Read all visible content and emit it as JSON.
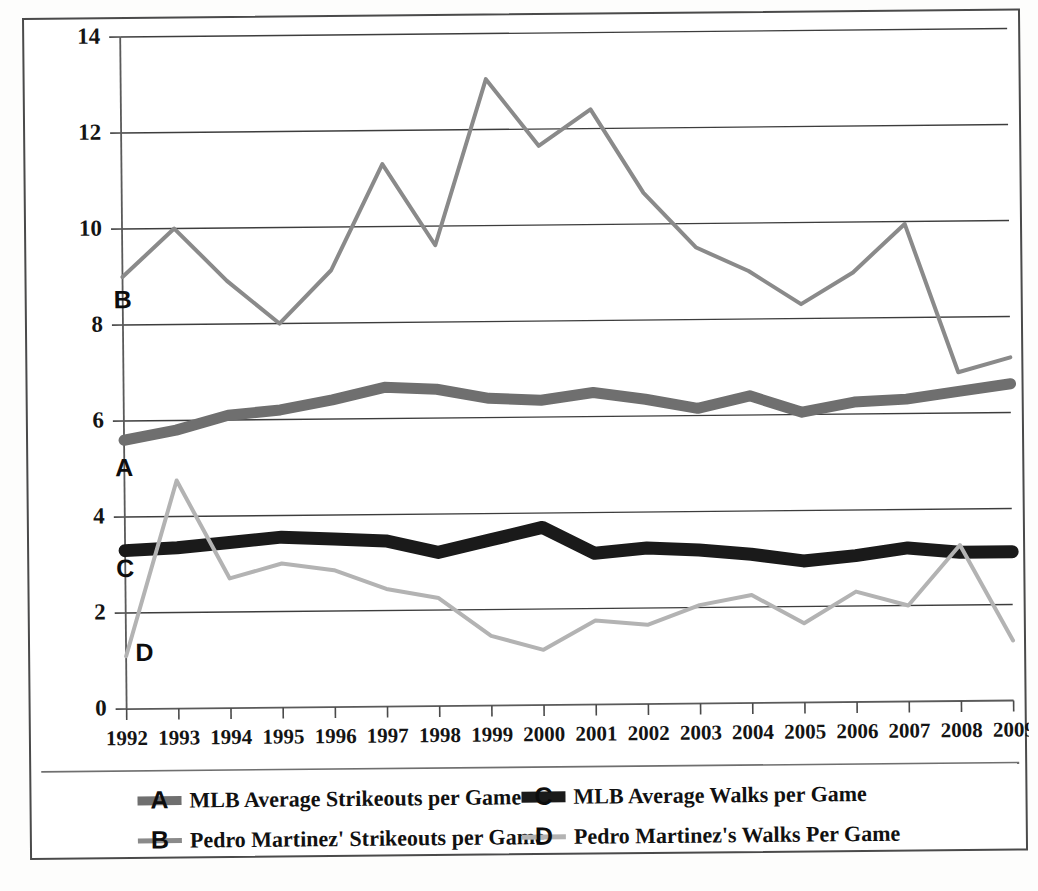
{
  "chart_data": {
    "type": "line",
    "title": "",
    "xlabel": "",
    "ylabel": "",
    "x": [
      1992,
      1993,
      1994,
      1995,
      1996,
      1997,
      1998,
      1999,
      2000,
      2001,
      2002,
      2003,
      2004,
      2005,
      2006,
      2007,
      2008,
      2009
    ],
    "categories": [
      "1992",
      "1993",
      "1994",
      "1995",
      "1996",
      "1997",
      "1998",
      "1999",
      "2000",
      "2001",
      "2002",
      "2003",
      "2004",
      "2005",
      "2006",
      "2007",
      "2008",
      "2009"
    ],
    "ylim": [
      0,
      14
    ],
    "ytick_values": [
      0,
      2,
      4,
      6,
      8,
      10,
      12,
      14
    ],
    "ytick_labels": [
      "0",
      "2",
      "4",
      "6",
      "8",
      "10",
      "12",
      "14"
    ],
    "grid": true,
    "legend_position": "bottom",
    "series": [
      {
        "key": "A",
        "tag": "A",
        "name": "MLB Average Strikeouts per Game",
        "color": "#6f6f6f",
        "width": 11,
        "values": [
          5.6,
          5.8,
          6.1,
          6.2,
          6.4,
          6.65,
          6.6,
          6.4,
          6.35,
          6.5,
          6.35,
          6.15,
          6.4,
          6.05,
          6.25,
          6.3,
          6.45,
          6.6
        ]
      },
      {
        "key": "B",
        "tag": "B",
        "name": "Pedro Martinez' Strikeouts per Game",
        "color": "#8a8a8a",
        "width": 4,
        "values": [
          9.0,
          10.0,
          8.9,
          8.0,
          9.1,
          11.3,
          9.6,
          13.05,
          11.65,
          12.4,
          10.65,
          9.5,
          9.0,
          8.3,
          8.95,
          9.95,
          6.85,
          7.15
        ]
      },
      {
        "key": "C",
        "tag": "C",
        "name": "MLB Average Walks per Game",
        "color": "#1a1a1a",
        "width": 13,
        "values": [
          3.3,
          3.35,
          3.45,
          3.55,
          3.5,
          3.45,
          3.2,
          3.45,
          3.7,
          3.15,
          3.25,
          3.2,
          3.1,
          2.95,
          3.05,
          3.2,
          3.1,
          3.1
        ]
      },
      {
        "key": "D",
        "tag": "D",
        "name": "Pedro Martinez's Walks Per Game",
        "color": "#b3b3b3",
        "width": 4,
        "values": [
          1.1,
          4.75,
          2.7,
          3.0,
          2.85,
          2.45,
          2.25,
          1.45,
          1.15,
          1.75,
          1.65,
          2.05,
          2.25,
          1.65,
          2.3,
          2.0,
          3.25,
          1.25
        ]
      }
    ],
    "inline_tags": [
      {
        "label": "B",
        "x": 1992,
        "y": 8.35
      },
      {
        "label": "A",
        "x": 1992,
        "y": 4.85
      },
      {
        "label": "C",
        "x": 1992,
        "y": 2.75
      },
      {
        "label": "D",
        "x": 1992.35,
        "y": 1.0
      }
    ],
    "legend": [
      {
        "letter": "A",
        "label": "MLB Average Strikeouts per Game",
        "color": "#6f6f6f",
        "width": 9
      },
      {
        "letter": "C",
        "label": "MLB Average Walks per Game",
        "color": "#1a1a1a",
        "width": 11
      },
      {
        "letter": "B",
        "label": "Pedro Martinez' Strikeouts per Game",
        "color": "#8a8a8a",
        "width": 5
      },
      {
        "letter": "D",
        "label": "Pedro Martinez's Walks Per Game",
        "color": "#b3b3b3",
        "width": 5
      }
    ]
  }
}
